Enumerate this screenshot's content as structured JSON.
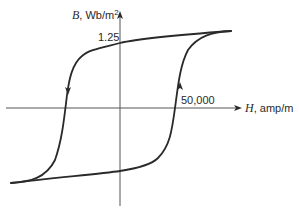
{
  "diagram": {
    "y_axis": {
      "variable": "B",
      "unit": ", Wb/m",
      "unit_superscript": "2"
    },
    "x_axis": {
      "variable": "H",
      "unit": ", amp/m"
    },
    "annotations": {
      "b_value": "1.25",
      "h_value": "50,000"
    },
    "loop": {
      "saturation_B": 1.25,
      "coercive_H": 50000,
      "direction": "counter-clockwise",
      "branches": [
        "descending (left, arrow down)",
        "ascending (right, arrow up)"
      ]
    },
    "colors": {
      "curve": "#2a2a2a",
      "axis": "#555555",
      "background": "#ffffff"
    }
  }
}
